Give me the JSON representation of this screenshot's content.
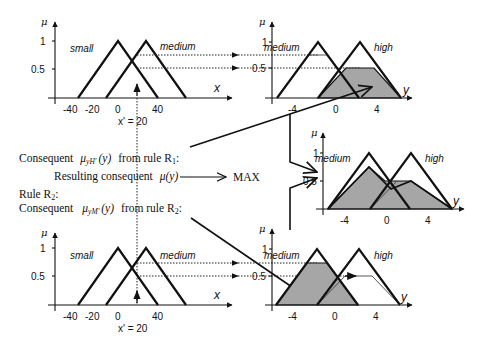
{
  "diagram": {
    "input_chart": {
      "y_axis_label": "μ",
      "x_axis_label": "x",
      "y_ticks": [
        "1",
        "0.5"
      ],
      "x_ticks": [
        "-40",
        "-20",
        "0",
        "40"
      ],
      "sets": [
        {
          "name": "small",
          "feet": [
            -40,
            40
          ],
          "peak": 0
        },
        {
          "name": "medium",
          "feet": [
            -10,
            70
          ],
          "peak": 30
        }
      ],
      "crisp_input_label": "x' = 20"
    },
    "output_chart": {
      "y_axis_label": "μ",
      "x_axis_label": "y",
      "y_ticks": [
        "1",
        "0.5"
      ],
      "x_ticks": [
        "-4",
        "0",
        "4"
      ],
      "sets": [
        {
          "name": "medium",
          "feet": [
            -6,
            2
          ],
          "peak": -2
        },
        {
          "name": "high",
          "feet": [
            -2,
            6
          ],
          "peak": 2
        }
      ]
    },
    "rule1": {
      "activation_medium": 0.75,
      "activation_high": 0.5,
      "consequent_label": "Consequent",
      "consequent_symbol": "μ",
      "consequent_sub": "yH'",
      "consequent_arg": "(y)",
      "consequent_from": "from rule R",
      "consequent_rule_sub": "1",
      "colon": ":"
    },
    "rule2": {
      "rule_label": "Rule R",
      "rule_sub": "2",
      "colon": ":",
      "consequent_label": "Consequent",
      "consequent_symbol": "μ",
      "consequent_sub": "yM'",
      "consequent_arg": "(y)",
      "consequent_from": "from rule R",
      "consequent_rule_sub": "2",
      "activation_medium": 0.75,
      "activation_high": 0.5
    },
    "resulting": {
      "label": "Resulting consequent",
      "symbol": "μ(y)",
      "operator": "MAX"
    },
    "colors": {
      "line": "#111111",
      "shade": "#a6a6a6",
      "background": "#ffffff"
    }
  }
}
